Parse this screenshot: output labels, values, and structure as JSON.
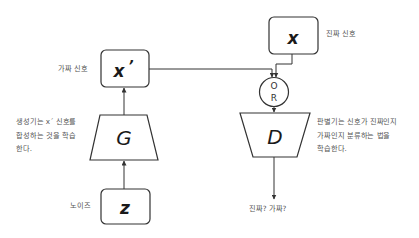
{
  "diagram": {
    "title": "",
    "nodes": {
      "fake_signal": {
        "symbol": "x",
        "prime": "’",
        "label": "가짜 신호"
      },
      "real_signal": {
        "symbol": "x",
        "label": "진짜 신호"
      },
      "generator": {
        "symbol": "G",
        "description_lines": [
          "생성기는 x´ 신호를",
          "합성하는 것을 학습",
          "한다."
        ]
      },
      "noise": {
        "symbol": "z",
        "label": "노이즈"
      },
      "or_gate": {
        "line1": "O",
        "line2": "R"
      },
      "discriminator": {
        "symbol": "D",
        "description_lines": [
          "판별기는 신호가 진짜인지",
          "가짜인지 분류하는 법을",
          "학습한다."
        ]
      },
      "output": {
        "label": "진짜? 가짜?"
      }
    },
    "edges": [
      {
        "from": "noise",
        "to": "generator"
      },
      {
        "from": "generator",
        "to": "fake_signal"
      },
      {
        "from": "fake_signal",
        "to": "or_gate"
      },
      {
        "from": "real_signal",
        "to": "or_gate"
      },
      {
        "from": "or_gate",
        "to": "discriminator"
      },
      {
        "from": "discriminator",
        "to": "output"
      }
    ],
    "colors": {
      "stroke": "#333333",
      "text": "#555555",
      "symbol": "#1a1a1a",
      "background": "#ffffff"
    }
  }
}
